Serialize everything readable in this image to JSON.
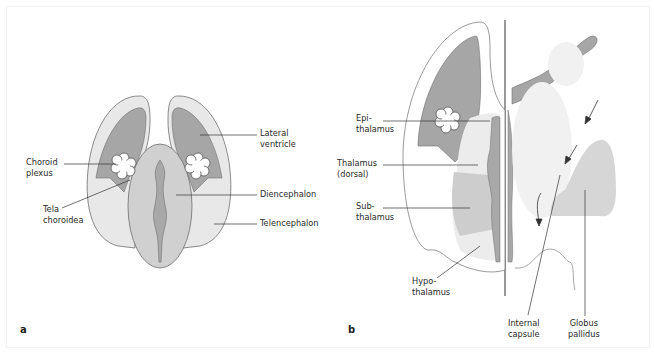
{
  "figure": {
    "colors": {
      "outline": "#6e6e6e",
      "ventricle": "#a6a6a6",
      "telencephalon": "#e6e6e6",
      "diencephalon": "#cfcfcf",
      "third_ventricle": "#a8a8a8",
      "subthalamus": "#cdcdcd",
      "thalamus": "#ececec",
      "globus_pallidus": "#d6d6d6",
      "line": "#333333"
    }
  },
  "panel_a": {
    "letter": "a",
    "labels": {
      "lateral_ventricle": "Lateral\nventricle",
      "choroid_plexus": "Choroid\nplexus",
      "diencephalon": "Diencephalon",
      "tela_choroidea": "Tela\nchoroidea",
      "telencephalon": "Telencephalon"
    }
  },
  "panel_b": {
    "letter": "b",
    "labels": {
      "epithalamus": "Epi-\nthalamus",
      "thalamus": "Thalamus\n(dorsal)",
      "subthalamus": "Sub-\nthalamus",
      "hypothalamus": "Hypo-\nthalamus",
      "internal_capsule": "Internal\ncapsule",
      "globus_pallidus": "Globus\npallidus"
    }
  }
}
